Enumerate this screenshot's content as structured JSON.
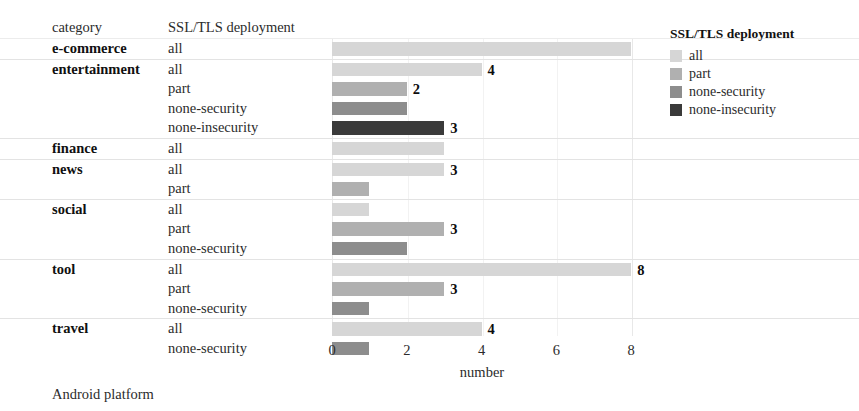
{
  "header": {
    "category_label": "category",
    "series_label": "SSL/TLS deployment"
  },
  "caption": "Android platform",
  "legend": {
    "title": "SSL/TLS deployment",
    "items": [
      {
        "label": "all",
        "color": "#d6d6d6"
      },
      {
        "label": "part",
        "color": "#b0b0b0"
      },
      {
        "label": "none-security",
        "color": "#8d8d8d"
      },
      {
        "label": "none-insecurity",
        "color": "#3a3a3a"
      }
    ]
  },
  "colors": {
    "all": "#d6d6d6",
    "part": "#b0b0b0",
    "none-security": "#8d8d8d",
    "none-insecurity": "#3a3a3a",
    "grid": "#e8e8e8",
    "text": "#2b2b2b"
  },
  "chart_data": {
    "type": "bar",
    "orientation": "horizontal",
    "title": "",
    "xlabel": "number",
    "ylabel": "",
    "xlim": [
      0,
      8.4
    ],
    "xticks": [
      0,
      2,
      4,
      6,
      8
    ],
    "grid": true,
    "legend_position": "right",
    "series_names": [
      "all",
      "part",
      "none-security",
      "none-insecurity"
    ],
    "groups": [
      {
        "category": "e-commerce",
        "rows": [
          {
            "series": "all",
            "value": 8,
            "label": ""
          }
        ]
      },
      {
        "category": "entertainment",
        "rows": [
          {
            "series": "all",
            "value": 4,
            "label": "4"
          },
          {
            "series": "part",
            "value": 2,
            "label": "2"
          },
          {
            "series": "none-security",
            "value": 2,
            "label": ""
          },
          {
            "series": "none-insecurity",
            "value": 3,
            "label": "3"
          }
        ]
      },
      {
        "category": "finance",
        "rows": [
          {
            "series": "all",
            "value": 3,
            "label": ""
          }
        ]
      },
      {
        "category": "news",
        "rows": [
          {
            "series": "all",
            "value": 3,
            "label": "3"
          },
          {
            "series": "part",
            "value": 1,
            "label": ""
          }
        ]
      },
      {
        "category": "social",
        "rows": [
          {
            "series": "all",
            "value": 1,
            "label": ""
          },
          {
            "series": "part",
            "value": 3,
            "label": "3"
          },
          {
            "series": "none-security",
            "value": 2,
            "label": ""
          }
        ]
      },
      {
        "category": "tool",
        "rows": [
          {
            "series": "all",
            "value": 8,
            "label": "8"
          },
          {
            "series": "part",
            "value": 3,
            "label": "3"
          },
          {
            "series": "none-security",
            "value": 1,
            "label": ""
          }
        ]
      },
      {
        "category": "travel",
        "rows": [
          {
            "series": "all",
            "value": 4,
            "label": "4"
          },
          {
            "series": "none-security",
            "value": 1,
            "label": ""
          }
        ]
      }
    ]
  }
}
